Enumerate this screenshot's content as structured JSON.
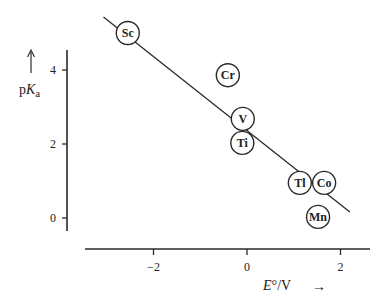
{
  "chart_data": {
    "type": "scatter",
    "title": "",
    "xlabel": "E°/V",
    "ylabel": "pKa",
    "xlim": [
      -3.3,
      2.6
    ],
    "ylim": [
      -0.6,
      4.6
    ],
    "xticks": [
      -2,
      0,
      2
    ],
    "yticks": [
      0,
      2,
      4
    ],
    "grid": false,
    "legend": null,
    "points": [
      {
        "label": "Sc",
        "x": -2.55,
        "y": 5.0
      },
      {
        "label": "Cr",
        "x": -0.41,
        "y": 3.86
      },
      {
        "label": "V",
        "x": -0.09,
        "y": 2.68
      },
      {
        "label": "Ti",
        "x": -0.1,
        "y": 2.03
      },
      {
        "label": "Tl",
        "x": 1.13,
        "y": 0.95
      },
      {
        "label": "Co",
        "x": 1.65,
        "y": 0.95
      },
      {
        "label": "Mn",
        "x": 1.52,
        "y": 0.03
      }
    ],
    "fit_line": {
      "x1": -3.07,
      "y1": 5.43,
      "x2": 2.2,
      "y2": 0.16
    }
  },
  "axes": {
    "y_label_prefix": "p",
    "y_label_main": "K",
    "y_label_sub": "a",
    "x_label_main": "E",
    "x_label_rest": "°/V",
    "x_arrow": "→",
    "y_arrow": "↑",
    "x_tick_labels": [
      "−2",
      "0",
      "2"
    ],
    "y_tick_labels": [
      "0",
      "2",
      "4"
    ]
  }
}
